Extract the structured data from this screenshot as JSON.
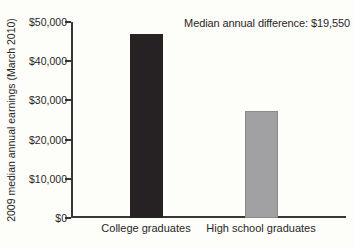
{
  "chart_data": {
    "type": "bar",
    "title": "",
    "xlabel": "",
    "ylabel": "2009 median annual earnings (March 2010)",
    "annotation": "Median annual difference: $19,550",
    "categories": [
      "College graduates",
      "High school graduates"
    ],
    "values": [
      46930,
      27380
    ],
    "bar_colors": [
      "#262223",
      "#a1a1a3"
    ],
    "bar_borders": [
      "none",
      "1px solid #8a8a8d"
    ],
    "ylim": [
      0,
      50000
    ],
    "yticks": [
      {
        "value": 0,
        "label": "$0"
      },
      {
        "value": 10000,
        "label": "$10,000"
      },
      {
        "value": 20000,
        "label": "$20,000"
      },
      {
        "value": 30000,
        "label": "$30,000"
      },
      {
        "value": 40000,
        "label": "$40,000"
      },
      {
        "value": 50000,
        "label": "$50,000"
      }
    ],
    "grid": false,
    "legend": null
  }
}
